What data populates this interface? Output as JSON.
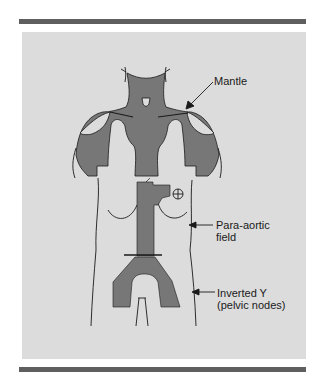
{
  "figure": {
    "colors": {
      "panel": "#dcdcdc",
      "field": "#777777",
      "outline": "#1a1a1a",
      "rule": "#5f5f5f"
    },
    "labels": {
      "mantle": "Mantle",
      "para_aortic_line1": "Para-aortic",
      "para_aortic_line2": "field",
      "inverted_y_line1": "Inverted Y",
      "inverted_y_line2": "(pelvic nodes)"
    },
    "fields": [
      "Mantle",
      "Para-aortic field",
      "Inverted Y (pelvic nodes)"
    ]
  }
}
